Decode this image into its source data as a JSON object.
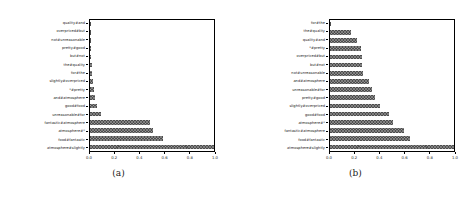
{
  "figure": {
    "panels": [
      {
        "caption": "(a)",
        "chart_data": {
          "type": "bar",
          "orientation": "horizontal",
          "title": "",
          "xlabel": "",
          "ylabel": "",
          "xlim": [
            0.0,
            1.0
          ],
          "xticks": [
            "0.0",
            "0.2",
            "0.4",
            "0.6",
            "0.8",
            "1.0"
          ],
          "xtick_values": [
            0.0,
            0.2,
            0.4,
            0.6,
            0.8,
            1.0
          ],
          "grid": false,
          "legend": "none",
          "bar_color": "#4d4d4d",
          "categories": [
            "quality#and",
            "overpriced#but",
            "not#unreasonable",
            "pretty#good",
            "but#not",
            "the#quality",
            "for#the",
            "slightly#overpriced",
            "*#pretty",
            "and#atmosphere",
            "good#food",
            "unreasonable#for",
            "fantastic#atmosphere",
            "atmosphere#*",
            "food#fantastic",
            "atmosphere#slightly"
          ],
          "values": [
            0.002,
            0.003,
            0.004,
            0.006,
            0.012,
            0.016,
            0.019,
            0.026,
            0.036,
            0.044,
            0.056,
            0.086,
            0.487,
            0.511,
            0.585,
            1.0
          ]
        }
      },
      {
        "caption": "(b)",
        "chart_data": {
          "type": "bar",
          "orientation": "horizontal",
          "title": "",
          "xlabel": "",
          "ylabel": "",
          "xlim": [
            0.0,
            1.0
          ],
          "xticks": [
            "0.0",
            "0.2",
            "0.4",
            "0.6",
            "0.8",
            "1.0"
          ],
          "xtick_values": [
            0.0,
            0.2,
            0.4,
            0.6,
            0.8,
            1.0
          ],
          "grid": false,
          "legend": "none",
          "bar_color": "#4d4d4d",
          "categories": [
            "for#the",
            "the#quality",
            "quality#and",
            "*#pretty",
            "overpriced#but",
            "but#not",
            "not#unreasonable",
            "and#atmosphere",
            "unreasonable#for",
            "pretty#good",
            "slightly#overpriced",
            "good#food",
            "atmosphere#*",
            "fantastic#atmosphere",
            "food#fantastic",
            "atmosphere#slightly"
          ],
          "values": [
            0.004,
            0.168,
            0.216,
            0.248,
            0.258,
            0.262,
            0.268,
            0.312,
            0.342,
            0.362,
            0.404,
            0.478,
            0.512,
            0.596,
            0.648,
            1.0
          ]
        }
      }
    ]
  }
}
